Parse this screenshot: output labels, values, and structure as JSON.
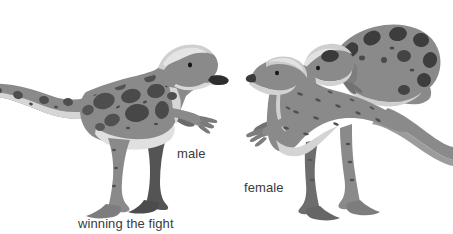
{
  "scene": {
    "width": 453,
    "height": 234,
    "background_color": "#ffffff",
    "subject": "dinosaur-courtship-illustration"
  },
  "labels": {
    "male": "male",
    "female": "female",
    "winning": "winning the fight",
    "text_color": "#3b3b3b"
  },
  "palette": {
    "body_gray": "#8a8a8a",
    "body_gray_dark": "#6f6f6f",
    "body_shadow": "#5d5d5d",
    "belly_light": "#d9d9d9",
    "crest_light": "#c9c9c9",
    "crest_highlight": "#e2e2e2",
    "spot_dark": "#4a4a4a",
    "spot_darker": "#3c3c3c",
    "limb_dark": "#545454",
    "outline": "#6a6a6a",
    "eye": "#1c1c1c",
    "snout_tip": "#2b2b2b"
  },
  "figures": [
    {
      "id": "male-standing",
      "name": "male-dinosaur-standing",
      "description": "large spotted male dinosaur standing, facing right, tail extending off left edge",
      "has_crest": true,
      "spotted": true,
      "label": "male"
    },
    {
      "id": "female-standing",
      "name": "female-dinosaur-standing",
      "description": "female dinosaur standing, facing left, plain gray body with small dashes, tail curving right",
      "has_crest": true,
      "spotted": false,
      "label": "female"
    },
    {
      "id": "male-defeated",
      "name": "male-dinosaur-crouching",
      "description": "spotted male dinosaur crouching low with head down, top right",
      "has_crest": true,
      "spotted": true,
      "label": "winning the fight"
    }
  ]
}
